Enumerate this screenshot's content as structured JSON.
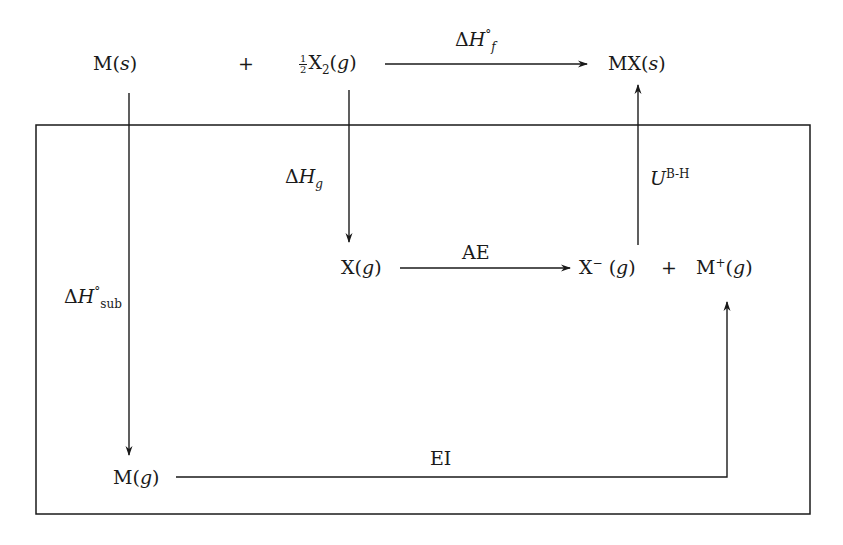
{
  "diagram": {
    "type": "Born-Haber cycle",
    "species": {
      "metal_solid": {
        "symbol": "M",
        "state": "s"
      },
      "plus_top": "+",
      "halogen_gas": {
        "coefficient_num": "1",
        "coefficient_den": "2",
        "symbol": "X",
        "subscript": "2",
        "state": "g"
      },
      "product_solid": {
        "symbol": "MX",
        "state": "s"
      },
      "halogen_atom_gas": {
        "symbol": "X",
        "state": "g"
      },
      "halide_ion_gas": {
        "symbol": "X",
        "charge": "−",
        "state": "g"
      },
      "plus_middle": "+",
      "metal_ion_gas": {
        "symbol": "M",
        "charge": "+",
        "state": "g"
      },
      "metal_gas": {
        "symbol": "M",
        "state": "g"
      }
    },
    "steps": {
      "formation": {
        "delta": "Δ",
        "symbol": "H",
        "sup": "°",
        "sub": "f"
      },
      "atomization": {
        "delta": "Δ",
        "symbol": "H",
        "sub": "g"
      },
      "sublimation": {
        "delta": "Δ",
        "symbol": "H",
        "sup": "°",
        "sub": "sub"
      },
      "electron_affinity": {
        "label": "AE"
      },
      "ionization": {
        "label": "EI"
      },
      "lattice_energy": {
        "symbol": "U",
        "sup": "B-H"
      }
    },
    "colors": {
      "ink": "#1a1a1a",
      "background": "#ffffff"
    }
  }
}
